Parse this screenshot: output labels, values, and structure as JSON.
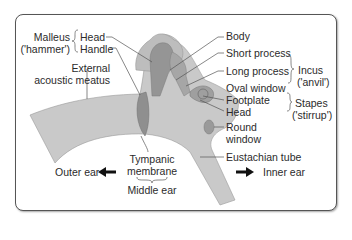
{
  "diagram": {
    "colors": {
      "tissue": "#c8c8c8",
      "bone_light": "#b4b4b4",
      "bone_dark": "#909090",
      "line": "#555555",
      "text": "#2b2b2b",
      "border": "#555555"
    },
    "labels": {
      "malleus": "Malleus",
      "malleus_common": "('hammer')",
      "malleus_head": "Head",
      "malleus_handle": "Handle",
      "external_meatus_1": "External",
      "external_meatus_2": "acoustic meatus",
      "body": "Body",
      "short_process": "Short process",
      "long_process": "Long process",
      "oval_window": "Oval window",
      "incus": "Incus",
      "incus_common": "('anvil')",
      "footplate": "Footplate",
      "stapes_head": "Head",
      "stapes": "Stapes",
      "stapes_common": "('stirrup')",
      "round_window_1": "Round",
      "round_window_2": "window",
      "eustachian_tube": "Eustachian tube",
      "tympanic_1": "Tympanic",
      "tympanic_2": "membrane",
      "middle_ear": "Middle ear",
      "outer_ear": "Outer ear",
      "inner_ear": "Inner ear"
    },
    "icons": {
      "left_arrow": "arrow-left-icon",
      "right_arrow": "arrow-right-icon"
    }
  }
}
